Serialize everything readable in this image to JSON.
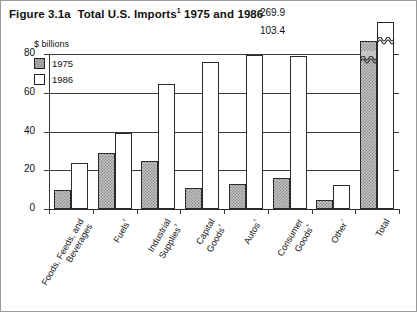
{
  "figure": {
    "title_prefix": "Figure 3.1a",
    "title_main": "Total U.S. Imports",
    "title_sup": "1",
    "title_suffix": "1975 and 1986",
    "units_label": "$ billions"
  },
  "legend": {
    "entries": [
      {
        "label": "1975",
        "swatch": "hatched-gray",
        "color": "#b9b9b9"
      },
      {
        "label": "1986",
        "swatch": "white",
        "color": "#ffffff"
      }
    ]
  },
  "axis": {
    "y_ticks": [
      "0",
      "20",
      "40",
      "60",
      "80"
    ],
    "y_min": 0,
    "y_max": 80
  },
  "total_callouts": {
    "value_1986": "269.9",
    "value_1975": "103.4"
  },
  "chart_data": {
    "type": "bar",
    "xlabel": "",
    "ylabel": "$ billions",
    "ylim": [
      0,
      80
    ],
    "grid": true,
    "legend_position": "top-left",
    "note": "The 'Total' group uses a broken (squiggle) axis; its true values are 103.4 and 269.9.",
    "categories": [
      "Foods, Feeds, and Beverages",
      "Fuels²",
      "Industrial Supplies³",
      "Capital Goods⁴",
      "Autos⁵",
      "Consumer Goods⁶",
      "Other⁷",
      "Total"
    ],
    "category_lines": [
      [
        "Foods, Feeds, and",
        "Beverages"
      ],
      [
        "Fuels²"
      ],
      [
        "Industrial",
        "Supplies³"
      ],
      [
        "Capital",
        "Goods⁴"
      ],
      [
        "Autos⁵"
      ],
      [
        "Consumer",
        "Goods⁶"
      ],
      [
        "Other⁷"
      ],
      [
        "Total"
      ]
    ],
    "series": [
      {
        "name": "1975",
        "values": [
          10.0,
          29.0,
          25.0,
          11.0,
          13.0,
          16.0,
          4.5,
          103.4
        ]
      },
      {
        "name": "1986",
        "values": [
          24.0,
          39.0,
          64.5,
          76.0,
          79.5,
          79.0,
          12.5,
          269.9
        ]
      }
    ]
  }
}
